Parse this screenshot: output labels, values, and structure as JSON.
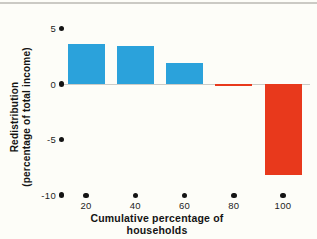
{
  "figure": {
    "background": "#fdfdf8",
    "top_rule_color": "#cbcac4"
  },
  "chart_data": {
    "type": "bar",
    "title": "",
    "xlabel": "Cumulative percentage of households",
    "ylabel": "Redistribution (percentage of total income)",
    "ylabel_lines": [
      "Redistribution",
      "(percentage of total income)"
    ],
    "categories": [
      20,
      40,
      60,
      80,
      100
    ],
    "values": [
      3.6,
      3.4,
      1.9,
      -0.2,
      -8.2
    ],
    "x_tick_labels": [
      "20",
      "40",
      "60",
      "80",
      "100"
    ],
    "y_ticks": [
      5,
      0,
      -5,
      -10
    ],
    "y_tick_labels": [
      "5",
      "0",
      "-5",
      "-10"
    ],
    "xlim": [
      10,
      110
    ],
    "ylim": [
      -10,
      5
    ],
    "grid": false,
    "legend": false,
    "tick_style": "dot-markers",
    "bar_colors": {
      "positive": "#2BA2DB",
      "negative": "#E8391C"
    },
    "axis_dot_color": "#141414",
    "zero_line_color": "#cdccc7"
  }
}
